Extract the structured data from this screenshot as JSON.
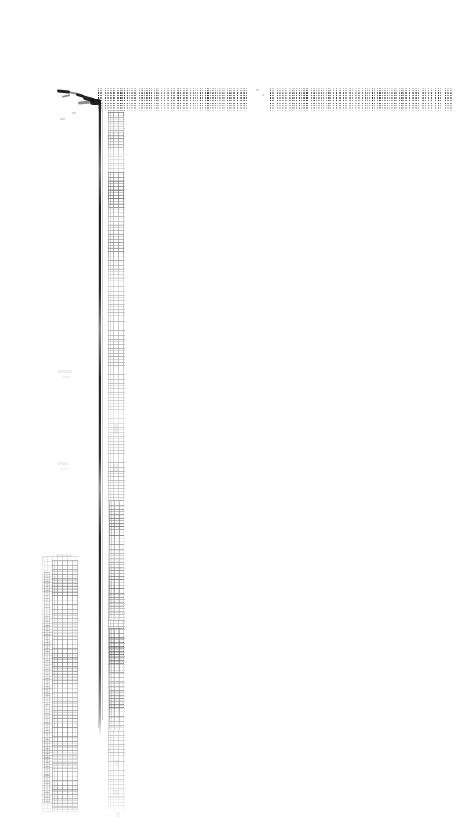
{
  "page": {
    "width_px": 460,
    "height_px": 824,
    "background_color": "#ffffff",
    "ink_color": "#141414",
    "condition": "heavily degraded scanned page; nearly all text illegible",
    "legible_text": ""
  },
  "header_band": {
    "label": "header text band",
    "left_column": {
      "label": "left header text block",
      "text": "",
      "legible": false
    },
    "right_column": {
      "label": "right header text block",
      "text": "",
      "legible": false
    }
  },
  "vertical_rule": {
    "label": "vertical rule",
    "text": ""
  },
  "faint_columns": {
    "inner": {
      "label": "faint inner text column",
      "text": "",
      "legible": false
    },
    "outer": {
      "label": "faint outer text column",
      "text": "",
      "legible": false
    }
  },
  "blot": {
    "label": "ink blot smudge",
    "text": ""
  },
  "marks": {
    "label": "scattered faint marks",
    "text": ""
  }
}
